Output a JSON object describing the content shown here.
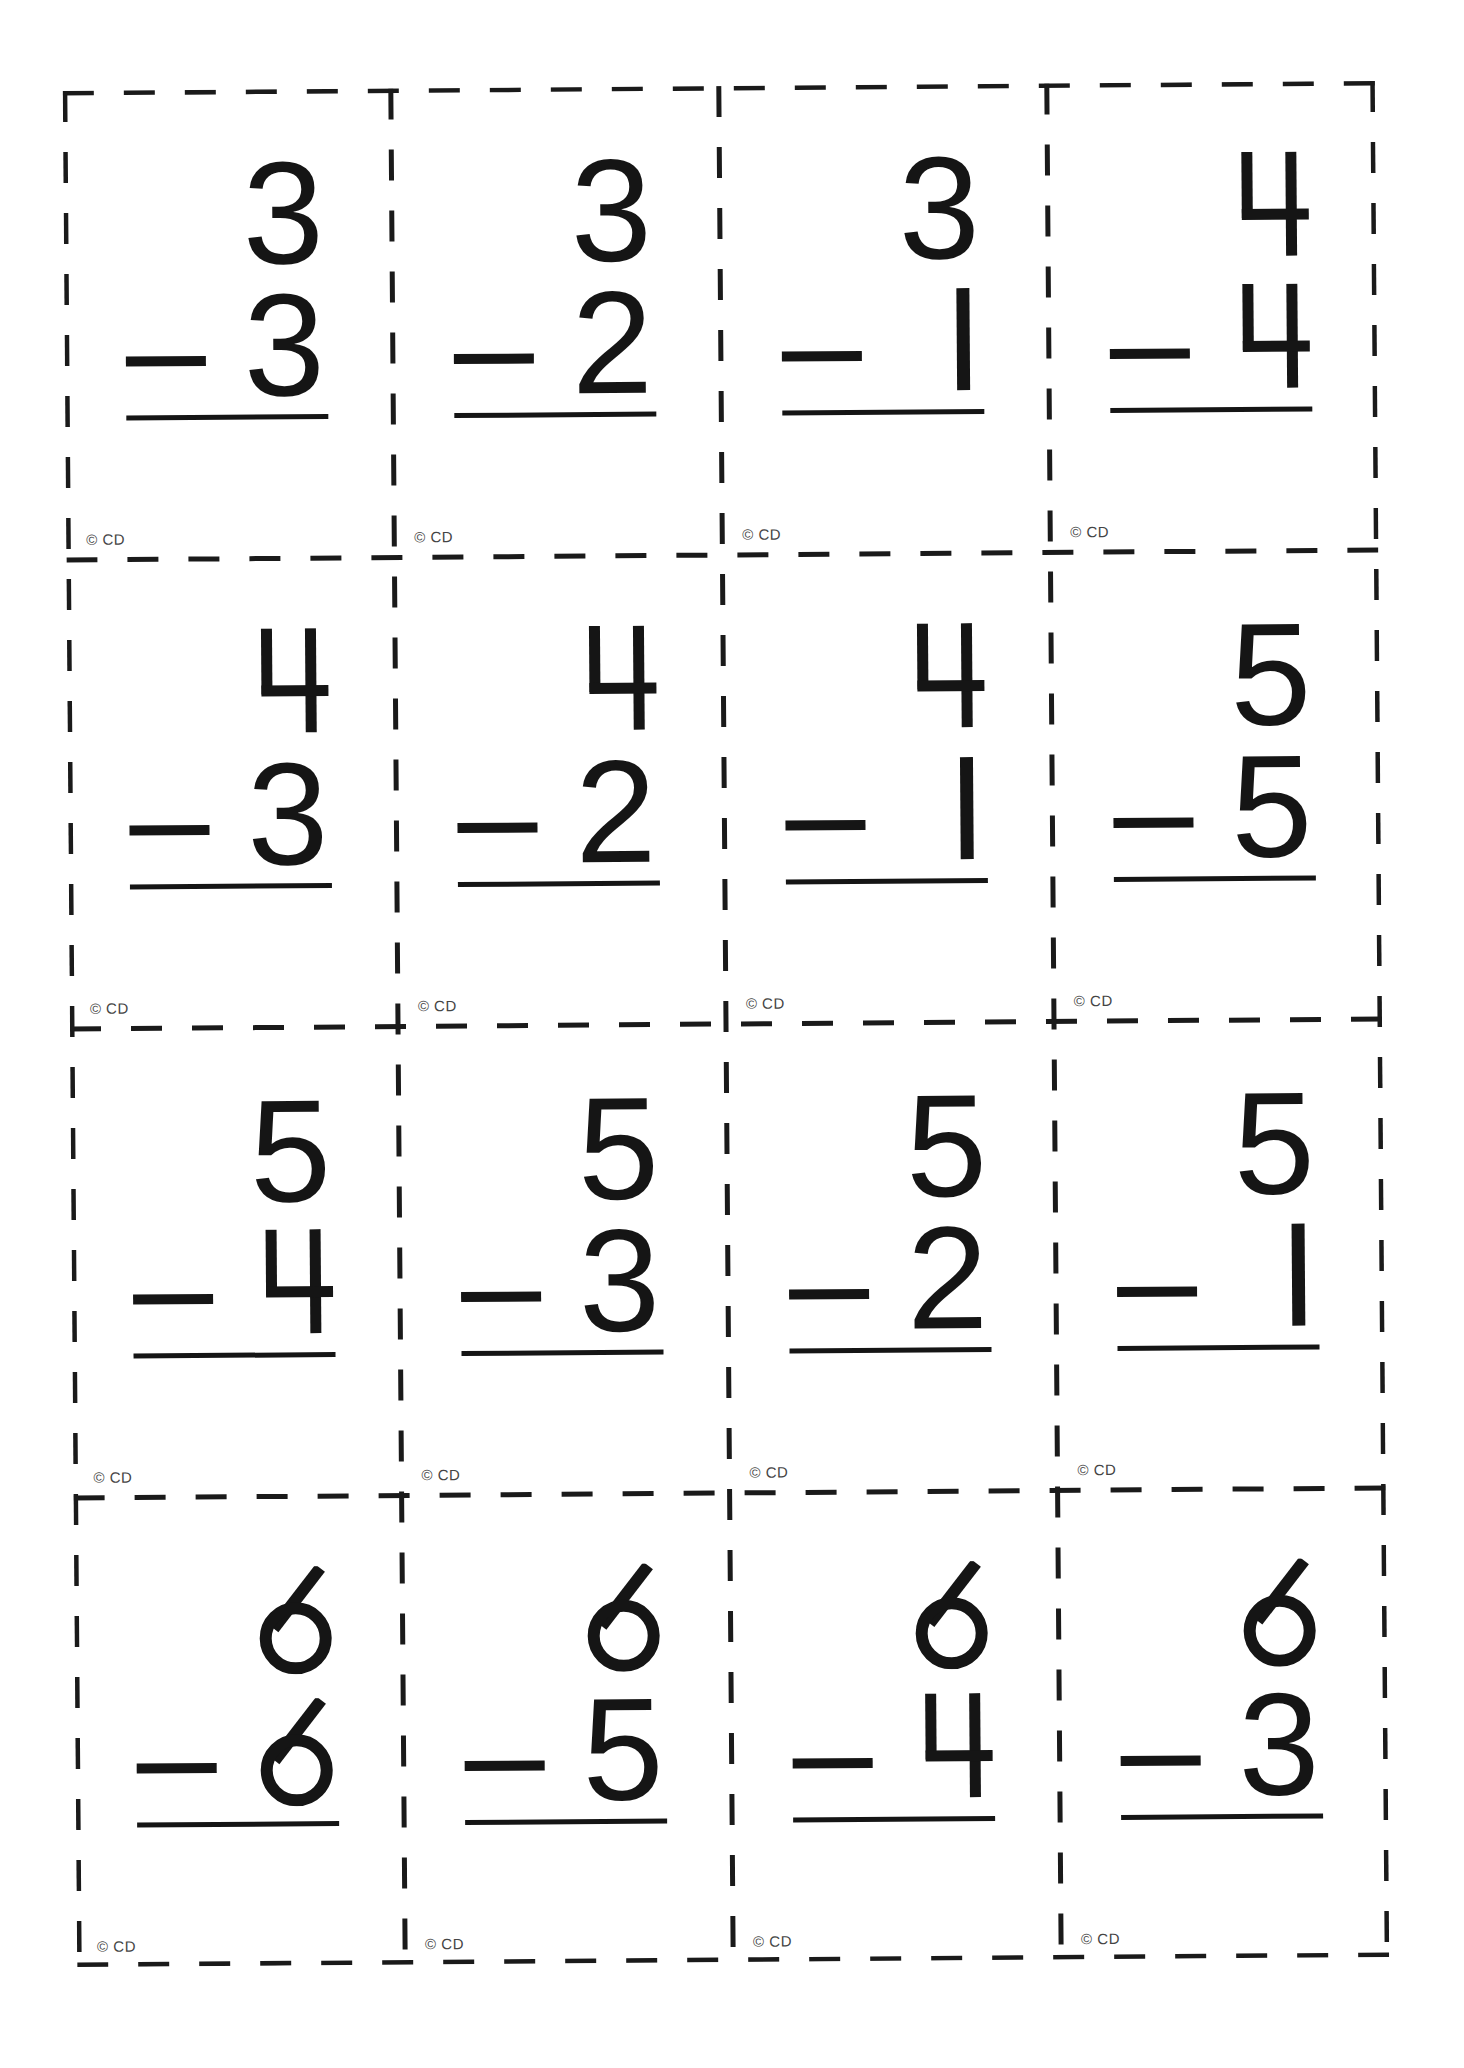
{
  "worksheet": {
    "title": "Subtraction flash cards",
    "copyright_label": "© CD",
    "operator": "−",
    "cards": [
      {
        "minuend": "3",
        "subtrahend": "3"
      },
      {
        "minuend": "3",
        "subtrahend": "2"
      },
      {
        "minuend": "3",
        "subtrahend": "1"
      },
      {
        "minuend": "4",
        "subtrahend": "4"
      },
      {
        "minuend": "4",
        "subtrahend": "3"
      },
      {
        "minuend": "4",
        "subtrahend": "2"
      },
      {
        "minuend": "4",
        "subtrahend": "1"
      },
      {
        "minuend": "5",
        "subtrahend": "5"
      },
      {
        "minuend": "5",
        "subtrahend": "4"
      },
      {
        "minuend": "5",
        "subtrahend": "3"
      },
      {
        "minuend": "5",
        "subtrahend": "2"
      },
      {
        "minuend": "5",
        "subtrahend": "1"
      },
      {
        "minuend": "6",
        "subtrahend": "6"
      },
      {
        "minuend": "6",
        "subtrahend": "5"
      },
      {
        "minuend": "6",
        "subtrahend": "4"
      },
      {
        "minuend": "6",
        "subtrahend": "3"
      }
    ],
    "layout": {
      "columns": 4,
      "rows": 4
    },
    "colors": {
      "ink": "#151515",
      "copyright": "#444444",
      "background": "#ffffff"
    }
  }
}
